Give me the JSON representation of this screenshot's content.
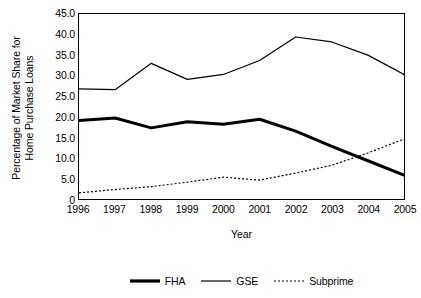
{
  "chart_data": {
    "type": "line",
    "title": "",
    "xlabel": "Year",
    "ylabel": "Percentage of Market Share for Home Purchase Loans",
    "ylabel_lines": [
      "Percentage of Market Share for",
      "Home Purchase Loans"
    ],
    "categories": [
      "1996",
      "1997",
      "1998",
      "1999",
      "2000",
      "2001",
      "2002",
      "2003",
      "2004",
      "2005"
    ],
    "x": [
      1996,
      1997,
      1998,
      1999,
      2000,
      2001,
      2002,
      2003,
      2004,
      2005
    ],
    "ylim": [
      0,
      45
    ],
    "xlim": [
      1996,
      2005
    ],
    "ytick_labels": [
      "45.0",
      "40.0",
      "35.0",
      "30.0",
      "25.0",
      "20.0",
      "15.0",
      "10.0",
      "5.0",
      "0"
    ],
    "ytick_values": [
      45,
      40,
      35,
      30,
      25,
      20,
      15,
      10,
      5,
      0
    ],
    "grid": false,
    "legend_position": "bottom",
    "series": [
      {
        "name": "FHA",
        "style": "thick-solid",
        "color": "#000000",
        "values": [
          19.1,
          19.7,
          17.3,
          18.8,
          18.2,
          19.4,
          16.5,
          12.8,
          9.3,
          5.8
        ]
      },
      {
        "name": "GSE",
        "style": "thin-solid",
        "color": "#000000",
        "values": [
          26.8,
          26.6,
          33.0,
          29.1,
          30.3,
          33.7,
          39.4,
          38.2,
          35.0,
          30.3
        ]
      },
      {
        "name": "Subprime",
        "style": "dotted",
        "color": "#000000",
        "values": [
          1.5,
          2.3,
          3.0,
          4.1,
          5.3,
          4.6,
          6.3,
          8.2,
          11.2,
          14.6
        ]
      }
    ]
  },
  "legend": {
    "items": [
      {
        "label": "FHA"
      },
      {
        "label": "GSE"
      },
      {
        "label": "Subprime"
      }
    ]
  }
}
